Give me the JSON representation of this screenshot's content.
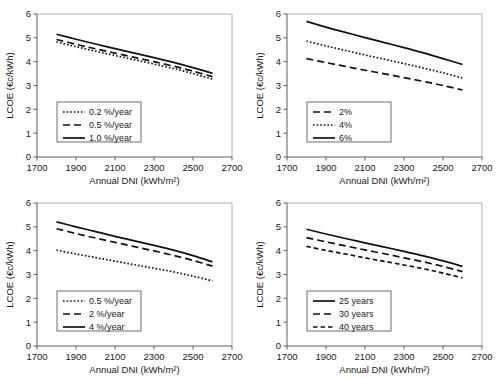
{
  "figure": {
    "panel_count": 4,
    "axis": {
      "xlabel": "Annual DNI (kWh/m²)",
      "ylabel": "LCOE (€c/kWh)",
      "xticks": [
        "1700",
        "1900",
        "2100",
        "2300",
        "2500",
        "2700"
      ],
      "yticks": [
        "0",
        "1",
        "2",
        "3",
        "4",
        "5",
        "6"
      ],
      "xlim": [
        1700,
        2700
      ],
      "ylim": [
        0,
        6
      ]
    }
  },
  "chart_data": [
    {
      "type": "line",
      "panel": "top-left",
      "title": "",
      "xlabel": "Annual DNI (kWh/m²)",
      "ylabel": "LCOE (€c/kWh)",
      "xlim": [
        1700,
        2700
      ],
      "ylim": [
        0,
        6
      ],
      "grid": false,
      "legend_position": "lower-left",
      "x": [
        1800,
        1900,
        2000,
        2100,
        2200,
        2300,
        2400,
        2500,
        2600
      ],
      "series": [
        {
          "name": "0.2 %/year",
          "style": "dotted",
          "values": [
            4.83,
            4.63,
            4.44,
            4.26,
            4.08,
            3.9,
            3.71,
            3.5,
            3.27
          ]
        },
        {
          "name": "0.5 %/year",
          "style": "dashed",
          "values": [
            4.93,
            4.73,
            4.54,
            4.36,
            4.18,
            4.0,
            3.81,
            3.6,
            3.37
          ]
        },
        {
          "name": "1.0 %/year",
          "style": "solid",
          "values": [
            5.15,
            4.94,
            4.74,
            4.55,
            4.36,
            4.17,
            3.97,
            3.75,
            3.51
          ]
        }
      ]
    },
    {
      "type": "line",
      "panel": "top-right",
      "title": "",
      "xlabel": "Annual DNI (kWh/m²)",
      "ylabel": "LCOE (€c/kWh)",
      "xlim": [
        1700,
        2700
      ],
      "ylim": [
        0,
        6
      ],
      "grid": false,
      "legend_position": "lower-left",
      "x": [
        1800,
        1900,
        2000,
        2100,
        2200,
        2300,
        2400,
        2500,
        2600
      ],
      "series": [
        {
          "name": "2%",
          "style": "dashed",
          "values": [
            4.13,
            3.96,
            3.8,
            3.64,
            3.49,
            3.33,
            3.17,
            3.0,
            2.81
          ]
        },
        {
          "name": "4%",
          "style": "dotted",
          "values": [
            4.86,
            4.66,
            4.47,
            4.28,
            4.1,
            3.92,
            3.73,
            3.53,
            3.31
          ]
        },
        {
          "name": "6%",
          "style": "solid",
          "values": [
            5.69,
            5.45,
            5.23,
            5.01,
            4.8,
            4.59,
            4.37,
            4.13,
            3.88
          ]
        }
      ]
    },
    {
      "type": "line",
      "panel": "bottom-left",
      "title": "",
      "xlabel": "Annual DNI (kWh/m²)",
      "ylabel": "LCOE (€c/kWh)",
      "xlim": [
        1700,
        2700
      ],
      "ylim": [
        0,
        6
      ],
      "grid": false,
      "legend_position": "lower-left",
      "x": [
        1800,
        1900,
        2000,
        2100,
        2200,
        2300,
        2400,
        2500,
        2600
      ],
      "series": [
        {
          "name": "0.5 %/year",
          "style": "dotted",
          "values": [
            4.02,
            3.86,
            3.71,
            3.56,
            3.41,
            3.26,
            3.11,
            2.93,
            2.73
          ]
        },
        {
          "name": "2 %/year",
          "style": "dashed",
          "values": [
            4.92,
            4.72,
            4.53,
            4.35,
            4.17,
            3.99,
            3.8,
            3.59,
            3.35
          ]
        },
        {
          "name": "4 %/year",
          "style": "solid",
          "values": [
            5.21,
            5.0,
            4.8,
            4.6,
            4.41,
            4.22,
            4.02,
            3.79,
            3.53
          ]
        }
      ]
    },
    {
      "type": "line",
      "panel": "bottom-right",
      "title": "",
      "xlabel": "Annual DNI (kWh/m²)",
      "ylabel": "LCOE (€c/kWh)",
      "xlim": [
        1700,
        2700
      ],
      "ylim": [
        0,
        6
      ],
      "grid": false,
      "legend_position": "lower-left",
      "x": [
        1800,
        1900,
        2000,
        2100,
        2200,
        2300,
        2400,
        2500,
        2600
      ],
      "series": [
        {
          "name": "25 years",
          "style": "solid",
          "values": [
            4.9,
            4.7,
            4.51,
            4.33,
            4.15,
            3.97,
            3.78,
            3.57,
            3.34
          ]
        },
        {
          "name": "30 years",
          "style": "dashed",
          "values": [
            4.55,
            4.37,
            4.2,
            4.03,
            3.87,
            3.7,
            3.53,
            3.34,
            3.12
          ]
        },
        {
          "name": "40 years",
          "style": "dashed-short",
          "values": [
            4.18,
            4.01,
            3.86,
            3.7,
            3.55,
            3.4,
            3.24,
            3.06,
            2.86
          ]
        }
      ]
    }
  ]
}
